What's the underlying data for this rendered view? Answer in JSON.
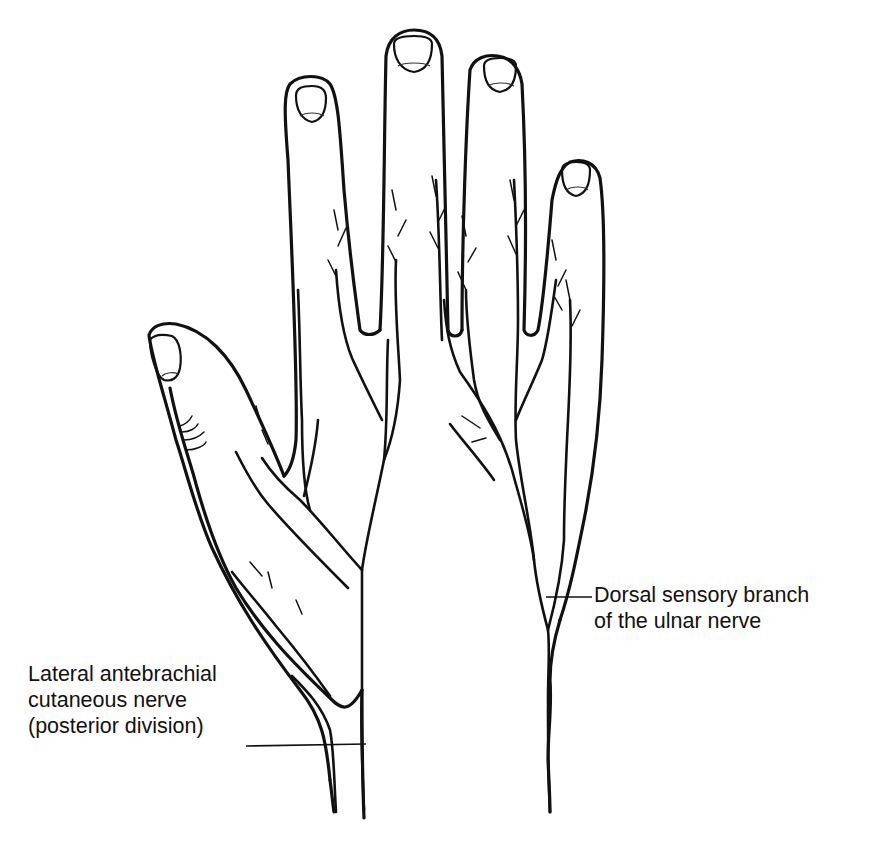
{
  "figure": {
    "labels": {
      "ulnar": {
        "line1": "Dorsal sensory branch",
        "line2": "of the ulnar nerve"
      },
      "lateral": {
        "line1": "Lateral antebrachial",
        "line2": "cutaneous nerve",
        "line3": "(posterior division)"
      }
    },
    "caption_fragment": "",
    "colors": {
      "ink": "#111111",
      "background": "#ffffff"
    }
  }
}
